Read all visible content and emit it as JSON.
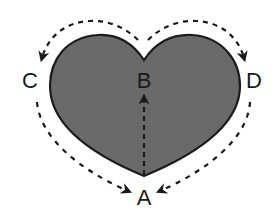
{
  "diagram": {
    "shape": "heart",
    "fill_color": "#6b6b6b",
    "stroke_color": "#1a1a1a",
    "labels": {
      "A": "A",
      "B": "B",
      "C": "C",
      "D": "D"
    },
    "paths": [
      {
        "from": "A",
        "to": "B",
        "style": "dashed-arrow",
        "description": "vertical inside heart from bottom tip A up to B"
      },
      {
        "from": "B",
        "to": "C",
        "style": "dashed-arrow",
        "description": "outside, over left lobe toward C"
      },
      {
        "from": "C",
        "to": "A",
        "style": "dashed-arrow",
        "description": "outside left side down to A"
      },
      {
        "from": "B",
        "to": "D",
        "style": "dashed-arrow",
        "description": "outside, over right lobe toward D"
      },
      {
        "from": "D",
        "to": "A",
        "style": "dashed-arrow",
        "description": "outside right side down to A"
      }
    ]
  }
}
